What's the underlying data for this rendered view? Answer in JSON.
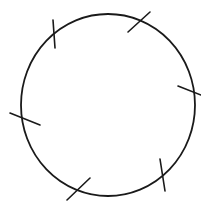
{
  "diagram": {
    "top_text_cut_off": "",
    "stroke_color": "#1a1a1a",
    "background": "#ffffff",
    "circle": {
      "cx": 108,
      "cy": 105,
      "rx": 87,
      "ry": 91
    },
    "ticks": [
      {
        "name": "tick-top-left",
        "x1": 53,
        "y1": 20,
        "x2": 55,
        "y2": 48
      },
      {
        "name": "tick-top-right",
        "x1": 128,
        "y1": 32,
        "x2": 150,
        "y2": 12
      },
      {
        "name": "tick-right",
        "x1": 178,
        "y1": 86,
        "x2": 201,
        "y2": 95
      },
      {
        "name": "tick-left",
        "x1": 10,
        "y1": 113,
        "x2": 40,
        "y2": 125
      },
      {
        "name": "tick-bottom-left",
        "x1": 67,
        "y1": 200,
        "x2": 90,
        "y2": 178
      },
      {
        "name": "tick-bottom-right",
        "x1": 160,
        "y1": 159,
        "x2": 165,
        "y2": 191
      }
    ]
  }
}
